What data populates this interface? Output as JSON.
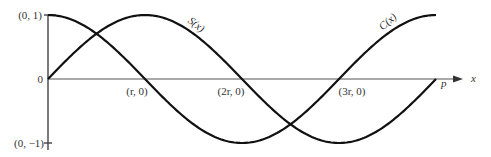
{
  "chart_data": {
    "type": "line",
    "title": "",
    "xlabel": "x",
    "ylabel": "",
    "grid": false,
    "legend": "inline curve labels",
    "ylim": [
      -1,
      1
    ],
    "xlim": [
      0,
      "p"
    ],
    "x_tick_labels": [
      "(r, 0)",
      "(2r, 0)",
      "(3r, 0)",
      "p"
    ],
    "y_tick_labels": [
      "(0, 1)",
      "0",
      "(0, −1)"
    ],
    "series": [
      {
        "name": "S(x)",
        "description": "sine-like: starts at (0,0), max 1 at r, zero at 2r, min −1 at 3r, zero at p",
        "x": [
          "0",
          "r",
          "2r",
          "3r",
          "p"
        ],
        "values": [
          0,
          1,
          0,
          -1,
          0
        ]
      },
      {
        "name": "C(x)",
        "description": "cosine-like: starts at (0,1), zero at r, min −1 at 2r, zero at 3r, max 1 at p",
        "x": [
          "0",
          "r",
          "2r",
          "3r",
          "p"
        ],
        "values": [
          1,
          0,
          -1,
          0,
          1
        ]
      }
    ]
  },
  "labels": {
    "y_top": "(0, 1)",
    "y_zero": "0",
    "y_bottom": "(0, −1)",
    "x_r": "(r, 0)",
    "x_2r": "(2r, 0)",
    "x_3r": "(3r, 0)",
    "x_p": "p",
    "x_axis": "x",
    "curve_s": "S(x)",
    "curve_c": "C(x)"
  }
}
